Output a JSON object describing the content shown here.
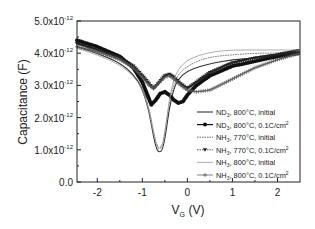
{
  "chart_data": {
    "type": "line",
    "title": "",
    "xlabel": "V_G (V)",
    "ylabel": "Capacitance (F)",
    "xlim": [
      -2.45,
      2.5
    ],
    "ylim": [
      0,
      5e-12
    ],
    "x_ticks": [
      -2,
      -1,
      0,
      1,
      2
    ],
    "x_tick_labels": [
      "-2",
      "-1",
      "0",
      "1",
      "2"
    ],
    "y_ticks": [
      0,
      1e-12,
      2e-12,
      3e-12,
      4e-12,
      5e-12
    ],
    "y_tick_labels": [
      "0.0",
      "1.0x10-12",
      "2.0x10-12",
      "3.0x10-12",
      "4.0x10-12",
      "5.0x10-12"
    ],
    "grid": false,
    "legend_position": "lower right",
    "y_unit_scale": 1e-12,
    "series": [
      {
        "name": "ND3, 800°C, initial",
        "style": "solid",
        "marker": "none",
        "x": [
          -2.45,
          -2.0,
          -1.5,
          -1.2,
          -1.0,
          -0.85,
          -0.75,
          -0.68,
          -0.62,
          -0.55,
          -0.48,
          -0.4,
          -0.3,
          -0.2,
          0.0,
          0.3,
          0.6,
          1.0,
          1.5,
          2.0,
          2.5
        ],
        "y": [
          4.2,
          4.0,
          3.7,
          3.35,
          2.9,
          2.2,
          1.4,
          1.0,
          0.92,
          1.0,
          1.5,
          2.3,
          2.9,
          3.2,
          3.45,
          3.6,
          3.7,
          3.8,
          3.85,
          3.95,
          4.05
        ]
      },
      {
        "name": "ND3, 800°C, 0.1C/cm2",
        "style": "solid",
        "marker": "circle",
        "x": [
          -2.45,
          -2.0,
          -1.5,
          -1.2,
          -1.0,
          -0.9,
          -0.8,
          -0.7,
          -0.6,
          -0.5,
          -0.4,
          -0.3,
          -0.2,
          -0.1,
          0.0,
          0.2,
          0.5,
          1.0,
          1.5,
          2.0,
          2.5
        ],
        "y": [
          4.4,
          4.2,
          3.9,
          3.55,
          3.1,
          2.75,
          2.4,
          2.55,
          2.75,
          2.8,
          2.7,
          2.55,
          2.45,
          2.5,
          2.7,
          3.0,
          3.3,
          3.6,
          3.75,
          3.9,
          4.0
        ]
      },
      {
        "name": "NH3, 770°C, initial",
        "style": "dotted",
        "marker": "none",
        "x": [
          -2.45,
          -2.0,
          -1.5,
          -1.2,
          -1.0,
          -0.85,
          -0.75,
          -0.68,
          -0.62,
          -0.55,
          -0.48,
          -0.4,
          -0.3,
          -0.2,
          0.0,
          0.3,
          0.6,
          1.0,
          1.5,
          2.0,
          2.5
        ],
        "y": [
          4.2,
          4.0,
          3.7,
          3.35,
          2.95,
          2.3,
          1.55,
          1.15,
          1.05,
          1.15,
          1.7,
          2.5,
          3.05,
          3.35,
          3.6,
          3.8,
          3.9,
          3.95,
          4.0,
          4.0,
          4.05
        ]
      },
      {
        "name": "NH3, 770°C, 0.1C/cm2",
        "style": "dotted",
        "marker": "triangle-down",
        "x": [
          -2.45,
          -2.0,
          -1.5,
          -1.2,
          -1.0,
          -0.85,
          -0.75,
          -0.65,
          -0.5,
          -0.4,
          -0.3,
          -0.15,
          0.0,
          0.2,
          0.5,
          1.0,
          1.5,
          2.0,
          2.5
        ],
        "y": [
          4.3,
          4.1,
          3.85,
          3.6,
          3.3,
          3.05,
          2.9,
          3.05,
          3.3,
          3.35,
          3.25,
          3.05,
          2.9,
          3.1,
          3.4,
          3.7,
          3.85,
          3.95,
          4.1
        ]
      },
      {
        "name": "NH3, 800°C, initial",
        "style": "thin",
        "marker": "none",
        "x": [
          -2.45,
          -2.0,
          -1.5,
          -1.2,
          -1.0,
          -0.85,
          -0.75,
          -0.68,
          -0.62,
          -0.55,
          -0.48,
          -0.4,
          -0.3,
          -0.2,
          0.0,
          0.3,
          0.6,
          1.0,
          1.5,
          2.0,
          2.5
        ],
        "y": [
          4.15,
          3.95,
          3.65,
          3.3,
          2.9,
          2.25,
          1.5,
          1.1,
          1.0,
          1.1,
          1.7,
          2.6,
          3.2,
          3.5,
          3.8,
          3.95,
          4.05,
          4.1,
          4.1,
          4.1,
          4.1
        ]
      },
      {
        "name": "NH3, 800°C, 0.1C/cm2",
        "style": "solid",
        "marker": "plus",
        "x": [
          -2.45,
          -2.0,
          -1.5,
          -1.2,
          -1.0,
          -0.85,
          -0.75,
          -0.65,
          -0.5,
          -0.4,
          -0.3,
          -0.15,
          0.0,
          0.2,
          0.5,
          1.0,
          1.5,
          2.0,
          2.5
        ],
        "y": [
          4.2,
          4.05,
          3.8,
          3.55,
          3.25,
          3.0,
          2.9,
          3.05,
          3.25,
          3.3,
          3.2,
          3.0,
          2.85,
          2.8,
          2.85,
          3.2,
          3.55,
          3.8,
          4.0
        ]
      }
    ]
  },
  "legend": {
    "entries": [
      {
        "label": "ND3, 800°C, initial"
      },
      {
        "label": "ND3, 800°C, 0.1C/cm2"
      },
      {
        "label": "NH3, 770°C, initial"
      },
      {
        "label": "NH3, 770°C, 0.1C/cm2"
      },
      {
        "label": "NH3, 800°C, initial"
      },
      {
        "label": "NH3, 800°C, 0.1C/cm2"
      }
    ]
  },
  "axes": {
    "xlabel_main": "V",
    "xlabel_sub": "G",
    "xlabel_unit": " (V)",
    "ylabel": "Capacitance (F)"
  }
}
